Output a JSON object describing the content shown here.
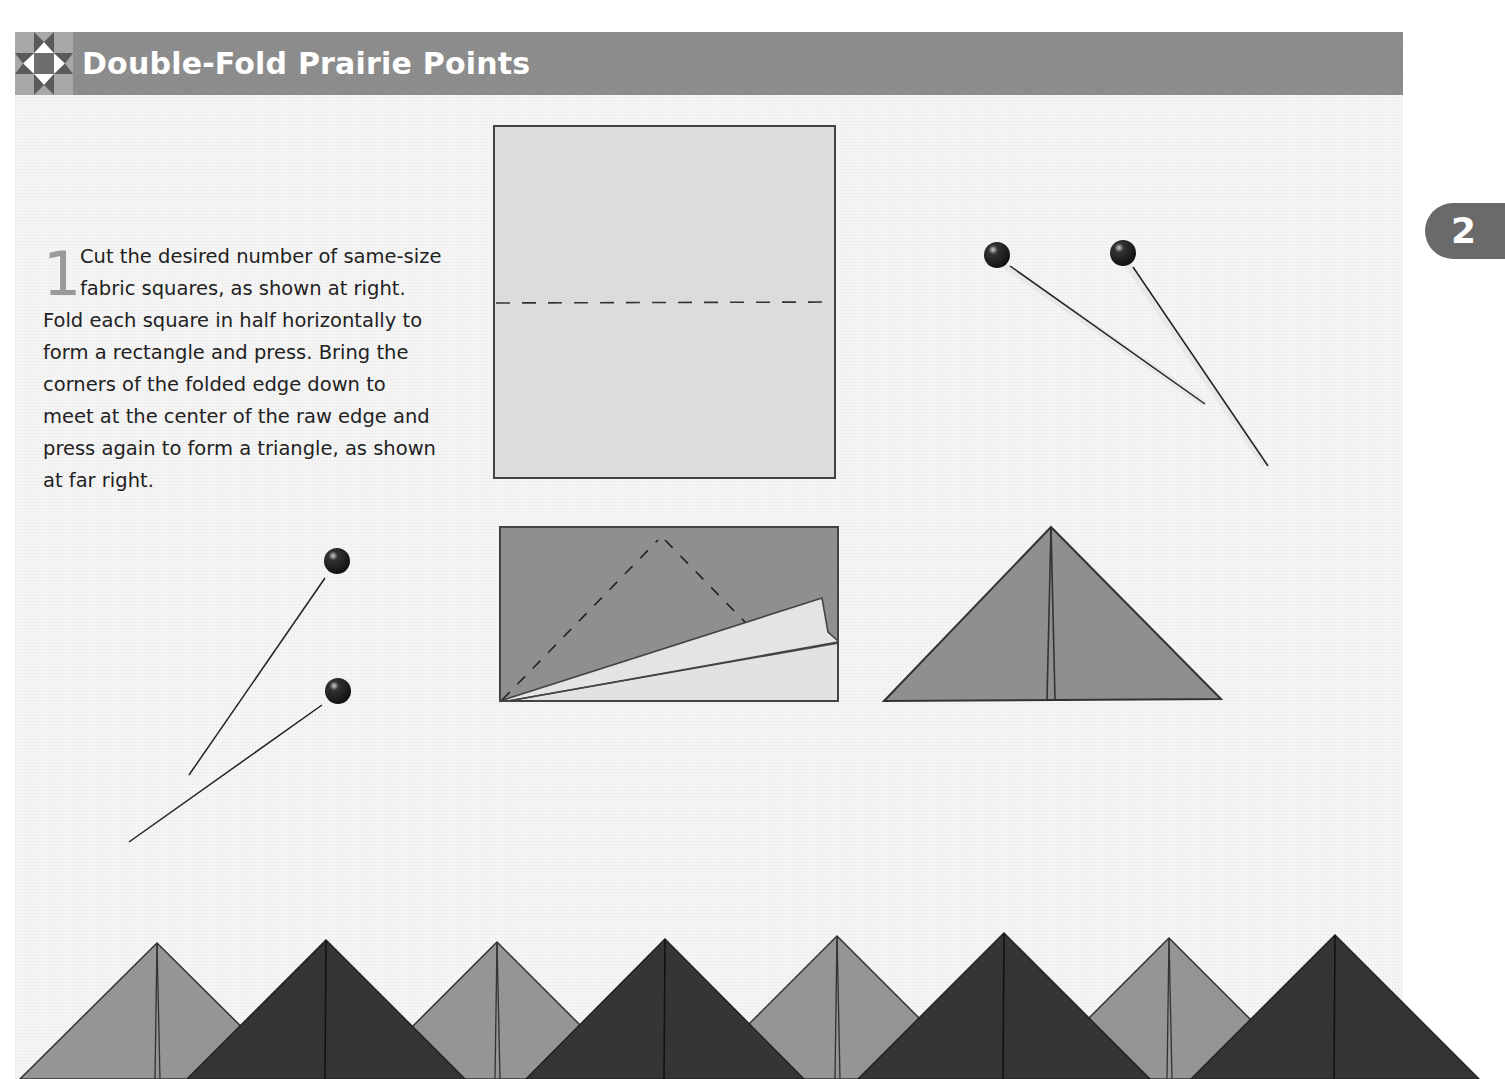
{
  "header": {
    "title": "Double-Fold Prairie Points",
    "icon": "quilt-star-block-icon",
    "band_color": "#8a8a8a"
  },
  "chapter_tab": {
    "label": "2"
  },
  "step": {
    "number": "1",
    "lines": [
      "Cut the desired number of same-size",
      "fabric squares, as shown at right.",
      "Fold each square in half horizontally to",
      "form a rectangle and press. Bring the",
      "corners of the folded edge down to",
      "meet at the center of the raw edge and",
      "press again to form a triangle, as shown",
      "at far right."
    ]
  },
  "illustrations": {
    "square": {
      "fill": "#dcdcdc",
      "fold_line": "dashed-horizontal"
    },
    "rectangle": {
      "fill": "#8f8f8f",
      "flap_fill": "#e4e4e4",
      "fold_lines": "dashed-diagonals"
    },
    "triangle": {
      "fill": "#8f8f8f"
    },
    "pins": [
      "pin-pair-top-right",
      "pin-pair-left"
    ]
  },
  "border_points": {
    "light_color": "#959595",
    "dark_color": "#353535",
    "light_apexes": [
      [
        157,
        943
      ],
      [
        497,
        942
      ],
      [
        837,
        936
      ],
      [
        1169,
        938
      ]
    ],
    "dark_apexes": [
      [
        326,
        940
      ],
      [
        665,
        939
      ],
      [
        1004,
        933
      ],
      [
        1335,
        935
      ]
    ]
  }
}
